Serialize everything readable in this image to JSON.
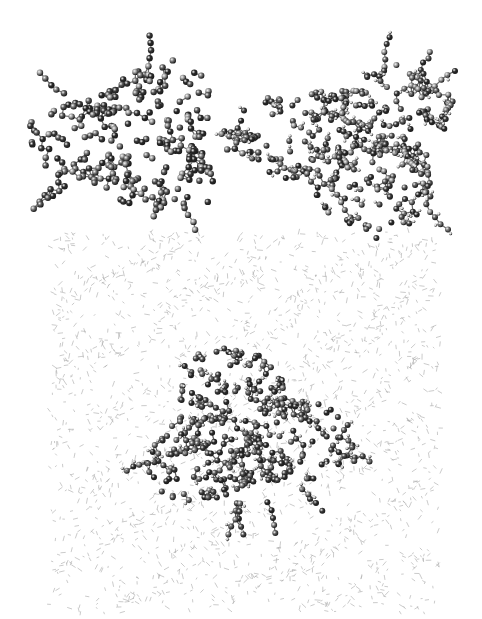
{
  "figure": {
    "background": "#ffffff",
    "panels": [
      {
        "id": "cluster-heavy-atoms",
        "description": "ball-and-stick molecular cluster without hydrogens",
        "box": {
          "x": 28,
          "y": 40,
          "w": 212,
          "h": 190
        },
        "center": {
          "x": 135,
          "y": 140
        },
        "radius": {
          "x": 90,
          "y": 70
        },
        "atom_count": 260,
        "atom_radius": 3.2,
        "atom_colors": [
          "#3a3a3a",
          "#5c5c5c",
          "#7a7a7a",
          "#9a9a9a",
          "#2a2a2a"
        ],
        "bond_color": "#6a6a6a",
        "hydrogens": false,
        "seed": 11
      },
      {
        "id": "cluster-with-hydrogens",
        "description": "ball-and-stick molecular cluster with hydrogens",
        "box": {
          "x": 250,
          "y": 12,
          "w": 230,
          "h": 228
        },
        "center": {
          "x": 355,
          "y": 145
        },
        "radius": {
          "x": 100,
          "y": 78
        },
        "atom_count": 340,
        "atom_radius": 3.0,
        "atom_colors": [
          "#3a3a3a",
          "#5c5c5c",
          "#7a7a7a",
          "#9a9a9a",
          "#2a2a2a"
        ],
        "bond_color": "#6a6a6a",
        "hydrogens": true,
        "hydrogen_color": "#d8d8d8",
        "seed": 23
      },
      {
        "id": "solvated-cluster",
        "description": "cluster embedded in solvent box (wireframe solvent molecules)",
        "box": {
          "x": 50,
          "y": 232,
          "w": 390,
          "h": 380
        },
        "solvent": {
          "line_count": 2600,
          "color": "#8a8a8a",
          "stripe_angle_deg": -30,
          "seed": 37
        },
        "center": {
          "x": 245,
          "y": 430
        },
        "radius": {
          "x": 95,
          "y": 70
        },
        "atom_count": 320,
        "atom_radius": 3.0,
        "atom_colors": [
          "#3a3a3a",
          "#4a4a4a",
          "#5f5f5f",
          "#7a7a7a",
          "#2a2a2a"
        ],
        "bond_color": "#555555",
        "hydrogens": true,
        "hydrogen_color": "#c8c8c8",
        "seed": 51
      }
    ]
  }
}
